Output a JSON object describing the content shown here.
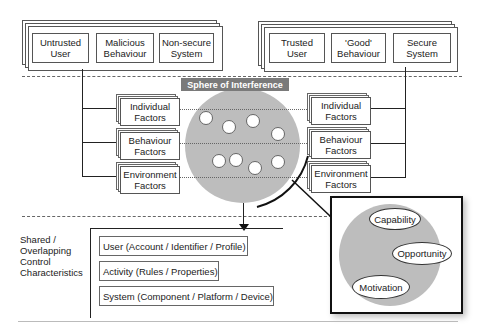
{
  "top_left_group": {
    "items": [
      "Untrusted\nUser",
      "Malicious\nBehaviour",
      "Non-secure\nSystem"
    ]
  },
  "top_right_group": {
    "items": [
      "Trusted User",
      "'Good'\nBehaviour",
      "Secure\nSystem"
    ]
  },
  "sphere": {
    "label": "Sphere of Interference",
    "fill_color": "#bdbdbd",
    "label_bg_color": "#7a7a7a"
  },
  "left_factors": [
    "Individual\nFactors",
    "Behaviour\nFactors",
    "Environment\nFactors"
  ],
  "right_factors": [
    "Individual\nFactors",
    "Behaviour\nFactors",
    "Environment\nFactors"
  ],
  "shared_controls": {
    "label": "Shared /\nOverlapping\nControl\nCharacteristics",
    "items": [
      "User (Account / Identifier / Profile)",
      "Activity (Rules / Properties)",
      "System (Component / Platform / Device)"
    ]
  },
  "detail_panel": {
    "ovals": [
      "Capability",
      "Opportunity",
      "Motivation"
    ]
  }
}
